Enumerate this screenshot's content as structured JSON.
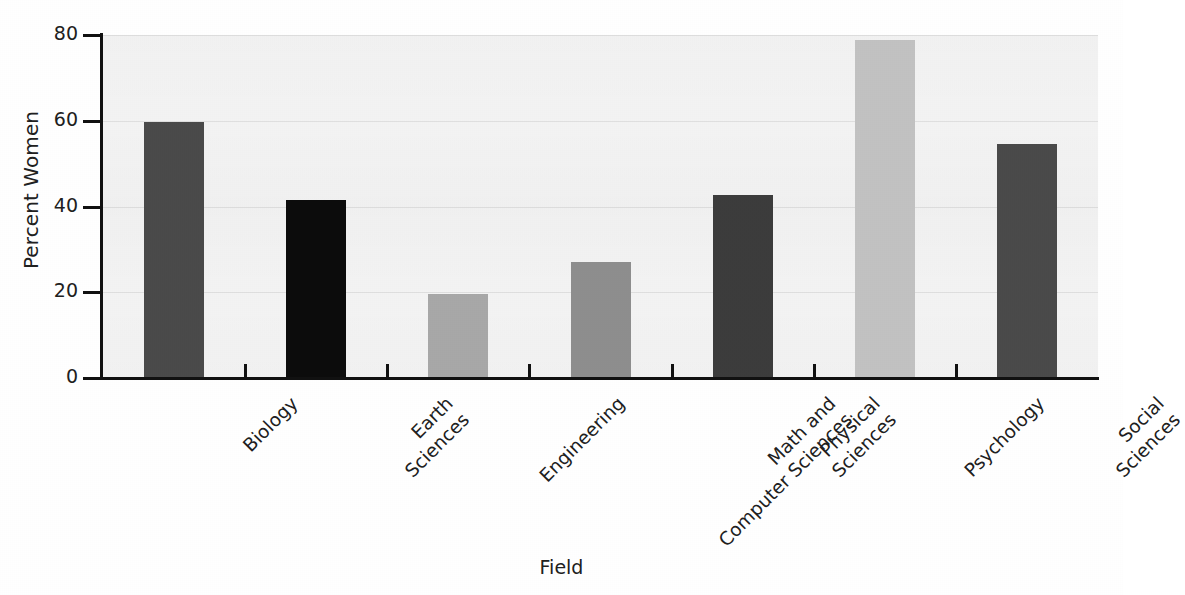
{
  "chart_data": {
    "type": "bar",
    "title": "",
    "xlabel": "Field",
    "ylabel": "Percent Women",
    "categories": [
      "Biology",
      "Earth Sciences",
      "Engineering",
      "Math and Computer Sciences",
      "Physical Sciences",
      "Psychology",
      "Social Sciences"
    ],
    "category_lines": [
      [
        "Biology"
      ],
      [
        "Earth",
        "Sciences"
      ],
      [
        "Engineering"
      ],
      [
        "Math and",
        "Computer Sciences"
      ],
      [
        "Physical",
        "Sciences"
      ],
      [
        "Psychology"
      ],
      [
        "Social",
        "Sciences"
      ]
    ],
    "values": [
      59.8,
      41.6,
      19.5,
      27.0,
      42.6,
      78.9,
      54.5
    ],
    "bar_colors": [
      "#4a4a4a",
      "#0c0c0c",
      "#a8a8a8",
      "#8e8e8e",
      "#3c3c3c",
      "#c2c2c2",
      "#4a4a4a"
    ],
    "ylim": [
      0,
      80
    ],
    "yticks": [
      0,
      20,
      40,
      60,
      80
    ],
    "ytick_labels": [
      "0",
      "20",
      "40",
      "60",
      "80"
    ],
    "grid": true,
    "grid_axis": "y",
    "legend": "none",
    "plot_background": "#f4f4f4",
    "axis_color": "#111111",
    "text_color": "#202020"
  }
}
